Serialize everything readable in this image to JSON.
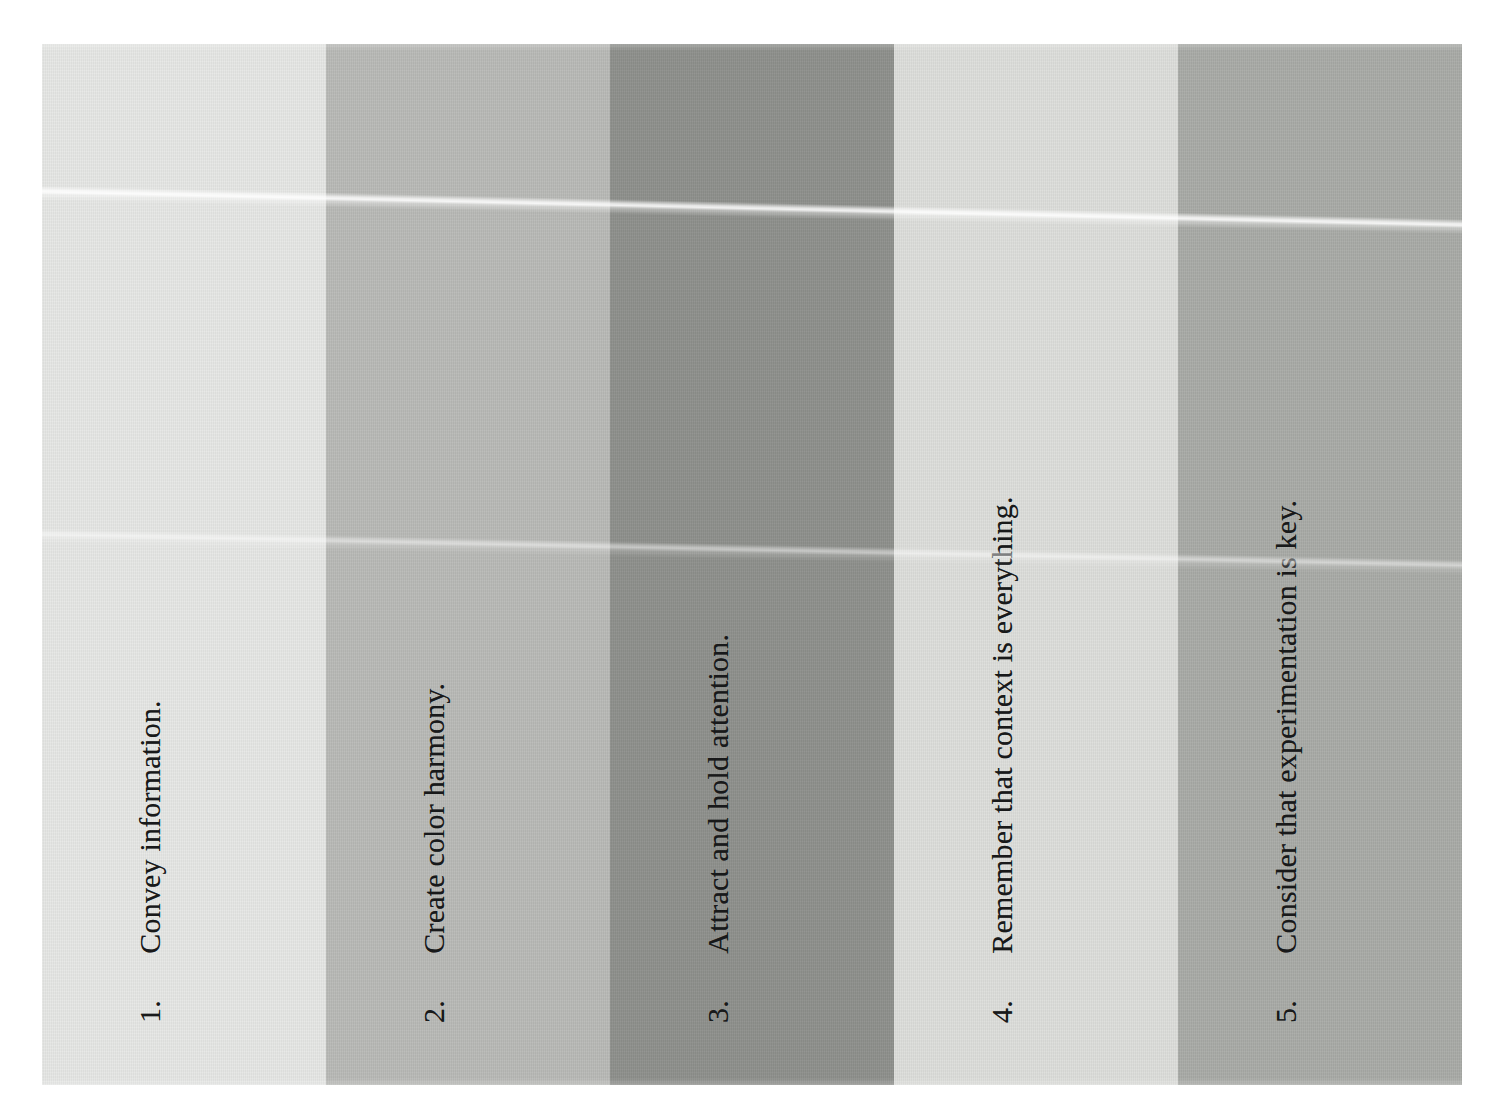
{
  "page": {
    "background_color": "#ffffff"
  },
  "swatches": {
    "band_label": "color-swatch-band",
    "columns": [
      {
        "number": "1.",
        "label": "Convey information.",
        "color": "#e7e8e6",
        "name": "swatch-column-1"
      },
      {
        "number": "2.",
        "label": "Create color harmony.",
        "color": "#b9bab7",
        "name": "swatch-column-2"
      },
      {
        "number": "3.",
        "label": "Attract and hold attention.",
        "color": "#8e908c",
        "name": "swatch-column-3"
      },
      {
        "number": "4.",
        "label": "Remember that context is everything.",
        "color": "#dedfdc",
        "name": "swatch-column-4"
      },
      {
        "number": "5.",
        "label": "Consider that experimentation is key.",
        "color": "#a9aba7",
        "name": "swatch-column-5"
      }
    ]
  },
  "artifacts": {
    "upper_streak": "scan-streak-upper",
    "lower_streak": "scan-streak-lower"
  }
}
